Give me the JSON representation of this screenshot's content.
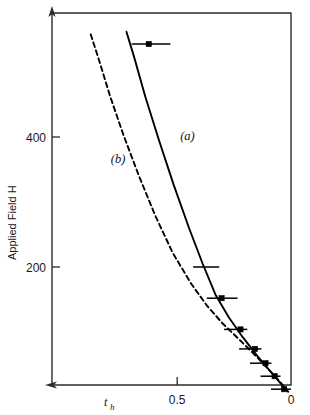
{
  "chart_data": {
    "type": "line",
    "title": "",
    "xlabel": "t_h",
    "xlabel_main": "t",
    "xlabel_sub": "h",
    "ylabel": "Applied Field H",
    "x_ticks": [
      {
        "value": 0.5,
        "label": "0.5"
      },
      {
        "value": 0.0,
        "label": "0"
      }
    ],
    "y_ticks": [
      {
        "value": 200,
        "label": "200"
      },
      {
        "value": 400,
        "label": "400"
      }
    ],
    "xlim": [
      1.05,
      0.0
    ],
    "ylim": [
      0,
      600
    ],
    "x_axis_reversed": true,
    "grid": false,
    "legend": "inline-curve-labels",
    "series": [
      {
        "name": "(a)",
        "label": "(a)",
        "style": "solid",
        "color": "#000000",
        "label_x": 0.455,
        "label_y": 395,
        "points": [
          {
            "x": 0.723,
            "y": 562
          },
          {
            "x": 0.69,
            "y": 524
          },
          {
            "x": 0.64,
            "y": 462
          },
          {
            "x": 0.58,
            "y": 395
          },
          {
            "x": 0.515,
            "y": 326
          },
          {
            "x": 0.448,
            "y": 260
          },
          {
            "x": 0.388,
            "y": 205
          },
          {
            "x": 0.33,
            "y": 156
          },
          {
            "x": 0.272,
            "y": 122
          },
          {
            "x": 0.212,
            "y": 92
          },
          {
            "x": 0.15,
            "y": 64
          },
          {
            "x": 0.092,
            "y": 40
          },
          {
            "x": 0.038,
            "y": 18
          }
        ]
      },
      {
        "name": "(b)",
        "label": "(b)",
        "style": "dashed",
        "color": "#000000",
        "label_x": 0.76,
        "label_y": 360,
        "points": [
          {
            "x": 0.88,
            "y": 558
          },
          {
            "x": 0.845,
            "y": 520
          },
          {
            "x": 0.795,
            "y": 463
          },
          {
            "x": 0.735,
            "y": 402
          },
          {
            "x": 0.668,
            "y": 340
          },
          {
            "x": 0.595,
            "y": 278
          },
          {
            "x": 0.52,
            "y": 222
          },
          {
            "x": 0.44,
            "y": 175
          },
          {
            "x": 0.368,
            "y": 140
          },
          {
            "x": 0.3,
            "y": 113
          },
          {
            "x": 0.232,
            "y": 90
          },
          {
            "x": 0.168,
            "y": 68
          },
          {
            "x": 0.105,
            "y": 45
          },
          {
            "x": 0.05,
            "y": 24
          },
          {
            "x": 0.012,
            "y": 8
          }
        ]
      }
    ],
    "data_points": [
      {
        "x": 0.625,
        "y": 543,
        "xerr_left": 0.075,
        "xerr_right": 0.095,
        "marker": "filled-square",
        "marker_visible": true
      },
      {
        "x": 0.375,
        "y": 200,
        "xerr_left": 0.055,
        "xerr_right": 0.06,
        "marker": "filled-square",
        "marker_visible": false
      },
      {
        "x": 0.305,
        "y": 152,
        "xerr_left": 0.065,
        "xerr_right": 0.07,
        "marker": "filled-square",
        "marker_visible": true
      },
      {
        "x": 0.222,
        "y": 104,
        "xerr_left": 0.072,
        "xerr_right": 0.03,
        "marker": "filled-square",
        "marker_visible": true
      },
      {
        "x": 0.158,
        "y": 74,
        "xerr_left": 0.07,
        "xerr_right": 0.028,
        "marker": "filled-square",
        "marker_visible": true
      },
      {
        "x": 0.112,
        "y": 52,
        "xerr_left": 0.068,
        "xerr_right": 0.026,
        "marker": "filled-square",
        "marker_visible": true
      },
      {
        "x": 0.072,
        "y": 32,
        "xerr_left": 0.062,
        "xerr_right": 0.026,
        "marker": "filled-square",
        "marker_visible": true
      },
      {
        "x": 0.03,
        "y": 12,
        "xerr_left": 0.058,
        "xerr_right": 0.03,
        "marker": "filled-square",
        "marker_visible": true
      }
    ],
    "colors": {
      "frame": "#2b2b2b",
      "curve": "#000000",
      "marker": "#000000",
      "text": "#1a1a1a"
    }
  }
}
